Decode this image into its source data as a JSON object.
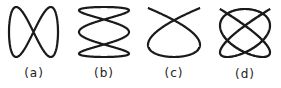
{
  "stroke_color": "#1a1a1a",
  "figures": [
    {
      "label": "(a)",
      "fx": 1,
      "fy": 2,
      "phase": 0,
      "box": [
        9,
        7,
        49,
        50
      ],
      "label_pos": [
        9,
        66
      ]
    },
    {
      "label": "(b)",
      "fx": 3,
      "fy": 1,
      "phase": 1.5708,
      "box": [
        79,
        7,
        50,
        50
      ],
      "label_pos": [
        79,
        66
      ]
    },
    {
      "label": "(c)",
      "fx": 3,
      "fy": 2,
      "phase": 0.785,
      "box": [
        148,
        8,
        52,
        49
      ],
      "label_pos": [
        149,
        66
      ]
    },
    {
      "label": "(d)",
      "fx": 5,
      "fy": 4,
      "phase": 0.4,
      "box": [
        220,
        9,
        50,
        48
      ],
      "label_pos": [
        220,
        67
      ]
    }
  ]
}
